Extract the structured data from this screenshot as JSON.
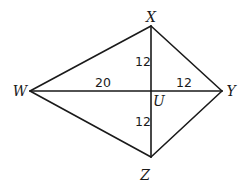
{
  "diagram": {
    "type": "kite-geometry",
    "vertices": {
      "X": {
        "label": "X",
        "x": 151,
        "y": 26,
        "label_x": 151,
        "label_y": 22
      },
      "W": {
        "label": "W",
        "x": 30,
        "y": 91,
        "label_x": 20,
        "label_y": 96
      },
      "Y": {
        "label": "Y",
        "x": 222,
        "y": 91,
        "label_x": 231,
        "label_y": 96
      },
      "Z": {
        "label": "Z",
        "x": 151,
        "y": 157,
        "label_x": 145,
        "label_y": 180
      },
      "U": {
        "label": "U",
        "x": 151,
        "y": 91,
        "label_x": 159,
        "label_y": 106
      }
    },
    "segments": [
      {
        "from": "W",
        "to": "X"
      },
      {
        "from": "X",
        "to": "Y"
      },
      {
        "from": "Y",
        "to": "Z"
      },
      {
        "from": "Z",
        "to": "W"
      },
      {
        "from": "W",
        "to": "Y"
      },
      {
        "from": "X",
        "to": "Z"
      }
    ],
    "measurements": {
      "XU": {
        "value": "12",
        "x": 143,
        "y": 66
      },
      "WU": {
        "value": "20",
        "x": 103,
        "y": 87
      },
      "UY": {
        "value": "12",
        "x": 184,
        "y": 87
      },
      "UZ": {
        "value": "12",
        "x": 143,
        "y": 126
      }
    },
    "colors": {
      "stroke": "#1a1a1a",
      "background": "#ffffff"
    }
  }
}
